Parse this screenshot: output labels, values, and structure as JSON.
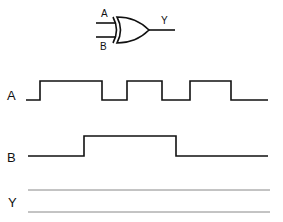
{
  "gate": {
    "type": "XOR",
    "input_a_label": "A",
    "input_b_label": "B",
    "output_label": "Y"
  },
  "waveforms": [
    {
      "label": "A",
      "x_start": 26,
      "x_end": 268,
      "high_y": 81,
      "low_y": 100,
      "transitions": [
        40,
        102,
        127,
        162,
        190,
        231
      ],
      "initial": "low"
    },
    {
      "label": "B",
      "x_start": 28,
      "x_end": 268,
      "high_y": 136,
      "low_y": 156,
      "transitions": [
        84,
        176
      ],
      "initial": "low"
    },
    {
      "label": "Y",
      "x_start": 28,
      "x_end": 270,
      "high_y": 190,
      "low_y": 212,
      "transitions": [],
      "initial": "blank",
      "note": "to be completed (empty guide lines)"
    }
  ],
  "colors": {
    "line": "#111111",
    "guide": "#888888",
    "background": "#ffffff"
  }
}
